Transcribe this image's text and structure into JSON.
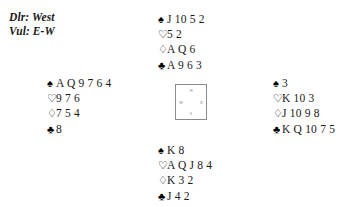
{
  "diagram": {
    "dealer_label": "Dlr: West",
    "vulnerability_label": "Vul: E-W"
  },
  "suit_symbols": {
    "spade": "♠",
    "heart": "♡",
    "diamond": "♢",
    "club": "♣"
  },
  "compass": {
    "north": "N",
    "south": "S",
    "west": "W",
    "east": "E"
  },
  "hands": {
    "north": {
      "position": "North",
      "spades": "J 10 5 2",
      "hearts": "5 2",
      "diamonds": "A Q 6",
      "clubs": "A 9 6 3"
    },
    "west": {
      "position": "West",
      "spades": "A Q 9 7 6 4",
      "hearts": "9 7 6",
      "diamonds": "7 5 4",
      "clubs": "8"
    },
    "east": {
      "position": "East",
      "spades": "3",
      "hearts": "K 10 3",
      "diamonds": "J 10 9 8",
      "clubs": "K Q 10 7 5"
    },
    "south": {
      "position": "South",
      "spades": "K 8",
      "hearts": "A Q J 8 4",
      "diamonds": "K 3 2",
      "clubs": "J 4 2"
    }
  }
}
